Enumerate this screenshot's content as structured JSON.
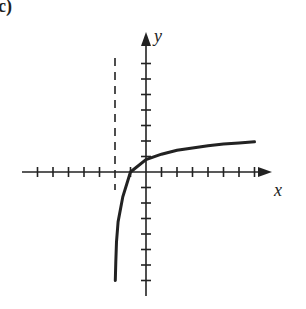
{
  "figure": {
    "panel_label": "(c)",
    "x_axis_label": "x",
    "y_axis_label": "y"
  },
  "chart_data": {
    "type": "line",
    "title": "",
    "xlabel": "x",
    "ylabel": "y",
    "xlim": [
      -7.5,
      8.5
    ],
    "ylim": [
      -8,
      7.5
    ],
    "x_ticks": [
      -7,
      -6,
      -5,
      -4,
      -3,
      -2,
      -1,
      1,
      2,
      3,
      4,
      5,
      6,
      7
    ],
    "y_ticks": [
      -7,
      -6,
      -5,
      -4,
      -3,
      -2,
      -1,
      1,
      2,
      3,
      4,
      5,
      6,
      7
    ],
    "tick_labels_shown": false,
    "grid": false,
    "asymptote": {
      "type": "vertical",
      "x": -2,
      "style": "dashed"
    },
    "series": [
      {
        "name": "y = log(x + 2)",
        "x": [
          -1.98,
          -1.95,
          -1.9,
          -1.8,
          -1.5,
          -1,
          0,
          1,
          2,
          3,
          4,
          5,
          6,
          7
        ],
        "y": [
          -7,
          -5.8,
          -4.5,
          -3.2,
          -1.6,
          0,
          0.8,
          1.15,
          1.4,
          1.55,
          1.7,
          1.8,
          1.88,
          1.95
        ]
      }
    ]
  },
  "colors": {
    "ink": "#222222",
    "background": "#ffffff"
  }
}
